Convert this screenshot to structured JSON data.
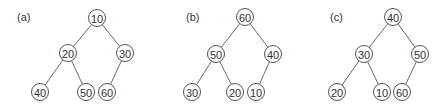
{
  "figure": {
    "panels": [
      {
        "label": "(a)",
        "nodes": [
          {
            "id": "a-10",
            "value": "10",
            "x": 97,
            "y": 18
          },
          {
            "id": "a-20",
            "value": "20",
            "x": 68,
            "y": 53
          },
          {
            "id": "a-30",
            "value": "30",
            "x": 125,
            "y": 53
          },
          {
            "id": "a-40",
            "value": "40",
            "x": 40,
            "y": 92
          },
          {
            "id": "a-50",
            "value": "50",
            "x": 86,
            "y": 92
          },
          {
            "id": "a-60",
            "value": "60",
            "x": 107,
            "y": 92
          }
        ],
        "edges": [
          [
            "a-10",
            "a-20"
          ],
          [
            "a-10",
            "a-30"
          ],
          [
            "a-20",
            "a-40"
          ],
          [
            "a-20",
            "a-50"
          ],
          [
            "a-30",
            "a-60"
          ]
        ],
        "label_pos": {
          "x": 17,
          "y": 21
        }
      },
      {
        "label": "(b)",
        "nodes": [
          {
            "id": "b-60",
            "value": "60",
            "x": 245,
            "y": 17
          },
          {
            "id": "b-50",
            "value": "50",
            "x": 216,
            "y": 54
          },
          {
            "id": "b-40",
            "value": "40",
            "x": 273,
            "y": 54
          },
          {
            "id": "b-30",
            "value": "30",
            "x": 192,
            "y": 92
          },
          {
            "id": "b-20",
            "value": "20",
            "x": 235,
            "y": 92
          },
          {
            "id": "b-10",
            "value": "10",
            "x": 256,
            "y": 92
          }
        ],
        "edges": [
          [
            "b-60",
            "b-50"
          ],
          [
            "b-60",
            "b-40"
          ],
          [
            "b-50",
            "b-30"
          ],
          [
            "b-50",
            "b-20"
          ],
          [
            "b-40",
            "b-10"
          ]
        ],
        "label_pos": {
          "x": 186,
          "y": 21
        }
      },
      {
        "label": "(c)",
        "nodes": [
          {
            "id": "c-40",
            "value": "40",
            "x": 393,
            "y": 17
          },
          {
            "id": "c-30",
            "value": "30",
            "x": 364,
            "y": 54
          },
          {
            "id": "c-50",
            "value": "50",
            "x": 420,
            "y": 54
          },
          {
            "id": "c-20",
            "value": "20",
            "x": 337,
            "y": 92
          },
          {
            "id": "c-10",
            "value": "10",
            "x": 382,
            "y": 92
          },
          {
            "id": "c-60",
            "value": "60",
            "x": 402,
            "y": 92
          }
        ],
        "edges": [
          [
            "c-40",
            "c-30"
          ],
          [
            "c-40",
            "c-50"
          ],
          [
            "c-30",
            "c-20"
          ],
          [
            "c-30",
            "c-10"
          ],
          [
            "c-50",
            "c-60"
          ]
        ],
        "label_pos": {
          "x": 330,
          "y": 21
        }
      }
    ],
    "node_radius": 8.5,
    "colors": {
      "edge": "#6a6a6a",
      "node_stroke": "#555555",
      "text": "#333333",
      "background": "#ffffff"
    }
  }
}
